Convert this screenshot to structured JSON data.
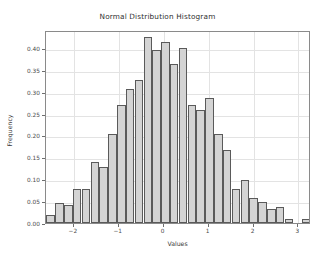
{
  "chart_data": {
    "type": "bar",
    "title": "Normal Distribution Histogram",
    "xlabel": "Values",
    "ylabel": "Frequency",
    "xlim": [
      -2.62,
      3.28
    ],
    "ylim": [
      0.0,
      0.4407
    ],
    "grid": true,
    "legend": null,
    "bin_width": 0.197,
    "xticks": [
      -2,
      -1,
      0,
      1,
      2,
      3
    ],
    "xtick_labels": [
      "−2",
      "−1",
      "0",
      "1",
      "2",
      "3"
    ],
    "yticks": [
      0.0,
      0.05,
      0.1,
      0.15,
      0.2,
      0.25,
      0.3,
      0.35,
      0.4
    ],
    "ytick_labels": [
      "0.00",
      "0.05",
      "0.10",
      "0.15",
      "0.20",
      "0.25",
      "0.30",
      "0.35",
      "0.40"
    ],
    "bar_color": "#d4d4d4",
    "edge_color": "#5a5a5a",
    "bin_centers": [
      -2.52,
      -2.32,
      -2.12,
      -1.93,
      -1.73,
      -1.53,
      -1.34,
      -1.14,
      -0.94,
      -0.75,
      -0.55,
      -0.35,
      -0.16,
      0.04,
      0.23,
      0.43,
      0.63,
      0.82,
      1.02,
      1.22,
      1.41,
      1.61,
      1.81,
      2.0,
      2.2,
      2.4,
      2.59,
      2.79,
      2.99,
      3.18
    ],
    "values": [
      0.019,
      0.045,
      0.041,
      0.077,
      0.077,
      0.139,
      0.129,
      0.203,
      0.269,
      0.306,
      0.327,
      0.424,
      0.395,
      0.414,
      0.363,
      0.399,
      0.269,
      0.259,
      0.285,
      0.203,
      0.166,
      0.077,
      0.099,
      0.057,
      0.047,
      0.032,
      0.036,
      0.01,
      0.0,
      0.01
    ]
  }
}
